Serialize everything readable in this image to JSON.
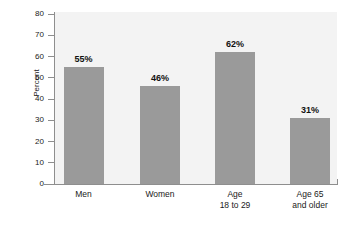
{
  "chart_data": {
    "type": "bar",
    "title": "",
    "xlabel": "",
    "ylabel": "Percent",
    "ylim": [
      0,
      80
    ],
    "ytick_step": 10,
    "yticks": [
      0,
      10,
      20,
      30,
      40,
      50,
      60,
      70,
      80
    ],
    "grid": false,
    "legend": null,
    "categories": [
      "Men",
      "Women",
      "Age\n18 to 29",
      "Age 65\nand older"
    ],
    "values": [
      55,
      46,
      62,
      31
    ],
    "data_labels": [
      "55%",
      "46%",
      "62%",
      "31%"
    ],
    "bar_color": "#9a9a9a",
    "plot_background": "#f3f3f3",
    "axis_color": "#8e8e8e",
    "label_color": "#111111"
  },
  "axis": {
    "y_title": "Percent",
    "ticks": [
      {
        "value": "80"
      },
      {
        "value": "70"
      },
      {
        "value": "60"
      },
      {
        "value": "50"
      },
      {
        "value": "40"
      },
      {
        "value": "30"
      },
      {
        "value": "20"
      },
      {
        "value": "10"
      },
      {
        "value": "0"
      }
    ]
  },
  "bars": [
    {
      "category": "Men",
      "label": "55%",
      "value": 55
    },
    {
      "category": "Women",
      "label": "46%",
      "value": 46
    },
    {
      "category": "Age\n18 to 29",
      "label": "62%",
      "value": 62
    },
    {
      "category": "Age 65\nand older",
      "label": "31%",
      "value": 31
    }
  ],
  "title_remnant": ""
}
